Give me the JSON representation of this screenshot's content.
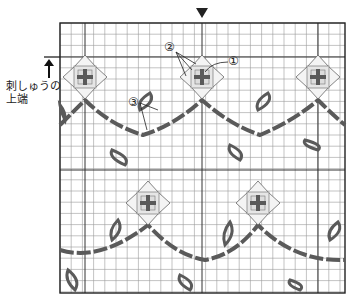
{
  "labels": {
    "top_edge_line1": "刺しゅうの",
    "top_edge_line2": "上端",
    "marker1": "①",
    "marker2": "②",
    "marker3": "③"
  },
  "colors": {
    "grid_minor": "#9a9a9a",
    "grid_major": "#333333",
    "stitch": "#5a5a5a",
    "motif_fill": "#e6e6e6"
  },
  "grid": {
    "left": 60,
    "top": 23,
    "right": 345,
    "bottom": 293,
    "cell": 11.2
  },
  "motifs": [
    {
      "x": 85,
      "y": 77
    },
    {
      "x": 202,
      "y": 77
    },
    {
      "x": 318,
      "y": 77
    },
    {
      "x": 148,
      "y": 203
    },
    {
      "x": 258,
      "y": 203
    }
  ]
}
